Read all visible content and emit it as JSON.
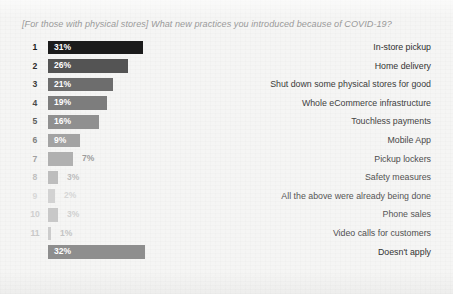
{
  "chart": {
    "title": "[For those with physical stores] What new practices you introduced because of COVID-19?"
  },
  "chart_data": {
    "type": "bar",
    "orientation": "horizontal",
    "title": "[For those with physical stores] What new practices you introduced because of COVID-19?",
    "xlabel": "",
    "ylabel": "",
    "xlim": [
      0,
      35
    ],
    "grid": false,
    "legend": false,
    "value_suffix": "%",
    "categories": [
      "In-store pickup",
      "Home delivery",
      "Shut down some physical stores for good",
      "Whole eCommerce infrastructure",
      "Touchless payments",
      "Mobile App",
      "Pickup lockers",
      "Safety measures",
      "All the above were already being done",
      "Phone sales",
      "Video calls for customers",
      "Doesn't apply"
    ],
    "values": [
      31,
      26,
      21,
      19,
      16,
      9,
      7,
      3,
      2,
      3,
      1,
      32
    ],
    "rows": [
      {
        "rank": "1",
        "value": 31,
        "value_label": "31%",
        "category": "In-store pickup",
        "bar_color": "#1b1b1b",
        "bar_width_px": 95,
        "value_inside": true,
        "rank_color": "#1b1b1b",
        "label_color": "#2f2f2f"
      },
      {
        "rank": "2",
        "value": 26,
        "value_label": "26%",
        "category": "Home delivery",
        "bar_color": "#545454",
        "bar_width_px": 80,
        "value_inside": true,
        "rank_color": "#2b2b2b",
        "label_color": "#333333"
      },
      {
        "rank": "3",
        "value": 21,
        "value_label": "21%",
        "category": "Shut down some physical stores for good",
        "bar_color": "#6d6d6d",
        "bar_width_px": 65,
        "value_inside": true,
        "rank_color": "#3a3a3a",
        "label_color": "#3a3a3a"
      },
      {
        "rank": "4",
        "value": 19,
        "value_label": "19%",
        "category": "Whole eCommerce infrastructure",
        "bar_color": "#7d7d7d",
        "bar_width_px": 59,
        "value_inside": true,
        "rank_color": "#4a4a4a",
        "label_color": "#3f3f3f"
      },
      {
        "rank": "5",
        "value": 16,
        "value_label": "16%",
        "category": "Touchless payments",
        "bar_color": "#909090",
        "bar_width_px": 51,
        "value_inside": true,
        "rank_color": "#5c5c5c",
        "label_color": "#444444"
      },
      {
        "rank": "6",
        "value": 9,
        "value_label": "9%",
        "category": "Mobile App",
        "bar_color": "#a3a3a3",
        "bar_width_px": 32,
        "value_inside": true,
        "rank_color": "#808080",
        "label_color": "#484848"
      },
      {
        "rank": "7",
        "value": 7,
        "value_label": "7%",
        "category": "Pickup lockers",
        "bar_color": "#b0b0b0",
        "bar_width_px": 25,
        "value_inside": false,
        "value_color": "#9c9c9c",
        "rank_color": "#a0a0a0",
        "label_color": "#4d4d4d"
      },
      {
        "rank": "8",
        "value": 3,
        "value_label": "3%",
        "category": "Safety measures",
        "bar_color": "#bdbdbd",
        "bar_width_px": 10,
        "value_inside": false,
        "value_color": "#bcbcbc",
        "rank_color": "#c0c0c0",
        "label_color": "#525252"
      },
      {
        "rank": "9",
        "value": 2,
        "value_label": "2%",
        "category": "All the above were already being done",
        "bar_color": "#d2d2d2",
        "bar_width_px": 7,
        "value_inside": false,
        "value_color": "#d6d6d6",
        "rank_color": "#d8d8d8",
        "label_color": "#565656"
      },
      {
        "rank": "10",
        "value": 3,
        "value_label": "3%",
        "category": "Phone sales",
        "bar_color": "#c8c8c8",
        "bar_width_px": 10,
        "value_inside": false,
        "value_color": "#d0d0d0",
        "rank_color": "#cfcfcf",
        "label_color": "#565656"
      },
      {
        "rank": "11",
        "value": 1,
        "value_label": "1%",
        "category": "Video calls for customers",
        "bar_color": "#cccccc",
        "bar_width_px": 3,
        "value_inside": false,
        "value_color": "#c4c4c4",
        "rank_color": "#c8c8c8",
        "label_color": "#4f4f4f"
      },
      {
        "rank": "",
        "value": 32,
        "value_label": "32%",
        "category": "Doesn't apply",
        "bar_color": "#8e8e8e",
        "bar_width_px": 97,
        "value_inside": true,
        "rank_color": "#8e8e8e",
        "label_color": "#333333"
      }
    ]
  }
}
